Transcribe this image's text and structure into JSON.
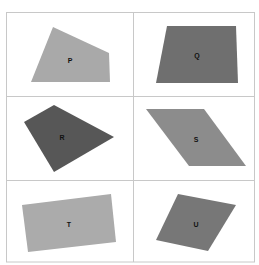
{
  "grid": {
    "rows": 3,
    "cols": 2,
    "line_color": "#c8c8c8",
    "left": 6,
    "top": 12,
    "right": 255,
    "bottom": 262,
    "col_split": 133,
    "row_splits": [
      96,
      180
    ]
  },
  "shapes": [
    {
      "label": "P",
      "type": "quadrilateral",
      "color": "#a9a9a9",
      "points": "53,27 109,53 110,82 31,82",
      "label_pos": [
        70,
        61
      ]
    },
    {
      "label": "Q",
      "type": "trapezoid",
      "color": "#6f6f6f",
      "points": "167,26 236,26 238,83 156,83",
      "label_pos": [
        197,
        56
      ]
    },
    {
      "label": "R",
      "type": "kite",
      "color": "#575757",
      "points": "54,105 114,137 54,172 24,122",
      "label_pos": [
        62,
        138
      ]
    },
    {
      "label": "S",
      "type": "parallelogram",
      "color": "#8c8c8c",
      "points": "146,109 204,109 246,166 189,166",
      "label_pos": [
        196,
        140
      ]
    },
    {
      "label": "T",
      "type": "rectangle",
      "color": "#ababab",
      "points": "22,205 111,194 116,242 28,252",
      "label_pos": [
        69,
        225
      ]
    },
    {
      "label": "U",
      "type": "rhombus",
      "color": "#777777",
      "points": "178,194 236,205 208,251 156,240",
      "label_pos": [
        196,
        225
      ]
    }
  ]
}
